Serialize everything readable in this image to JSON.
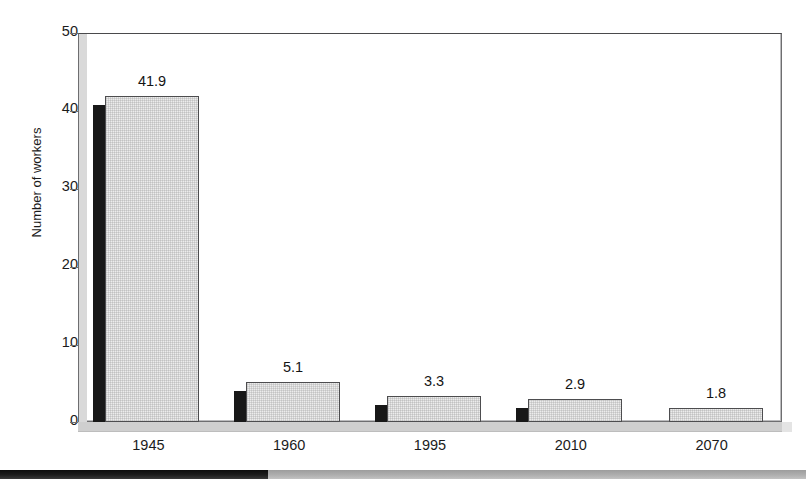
{
  "figure": {
    "cropped_title_ghost": "",
    "background_color": "#ffffff"
  },
  "footer": {
    "dark_label": "",
    "light_label": "",
    "dark_color": "#121212",
    "light_color": "#a8a8a8",
    "split_x": 268
  },
  "chart_data": {
    "type": "bar",
    "title": "",
    "xlabel": "",
    "ylabel": "Number of workers",
    "categories": [
      "1945",
      "1960",
      "1995",
      "2010",
      "2070"
    ],
    "values": [
      41.9,
      5.1,
      3.3,
      2.9,
      1.8
    ],
    "data_labels": [
      "41.9",
      "5.1",
      "3.3",
      "2.9",
      "1.8"
    ],
    "ylim": [
      0,
      50
    ],
    "yticks": [
      0,
      10,
      20,
      30,
      40,
      50
    ],
    "ytick_labels": [
      "0",
      "10",
      "20",
      "30",
      "40",
      "50"
    ],
    "grid": false,
    "legend": false,
    "style": "3d-shadow-bar",
    "bar_fill_color": "#ececec",
    "bar_edge_color": "#4d4d4f",
    "bar_shadow_color": "#181818",
    "axis_color": "#6e6e70",
    "ground_color": "#cfcfcf"
  }
}
